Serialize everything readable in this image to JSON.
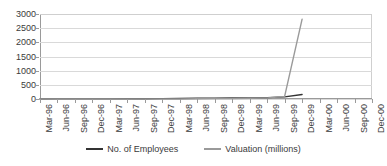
{
  "chart_data": {
    "type": "line",
    "title": "",
    "xlabel": "",
    "ylabel": "",
    "ylim": [
      0,
      3000
    ],
    "ytick_step": 500,
    "yticks": [
      "3000",
      "2500",
      "2000",
      "1500",
      "1000",
      "500",
      "0"
    ],
    "grid": true,
    "legend_position": "bottom-center",
    "categories": [
      "Mar-96",
      "Jun-96",
      "Sep-96",
      "Dec-96",
      "Mar-97",
      "Jun-97",
      "Sep-97",
      "Dec-97",
      "Mar-98",
      "Jun-98",
      "Sep-98",
      "Dec-98",
      "Mar-99",
      "Jun-99",
      "Sep-99",
      "Dec-99",
      "Mar-00",
      "Jun-00",
      "Sep-00",
      "Dec-00"
    ],
    "series": [
      {
        "name": "No. of Employees",
        "color": "#333333",
        "values": [
          2,
          3,
          4,
          5,
          6,
          8,
          10,
          12,
          18,
          25,
          30,
          34,
          40,
          50,
          75,
          160,
          null,
          null,
          null,
          null
        ]
      },
      {
        "name": "Valuation (millions)",
        "color": "#9a9a9a",
        "values": [
          0,
          0,
          0,
          1,
          1,
          2,
          3,
          4,
          6,
          10,
          14,
          18,
          25,
          40,
          90,
          2820,
          null,
          null,
          null,
          null
        ]
      }
    ],
    "annotations": [
      "Valuation spikes sharply to approximately 2800 million around Dec-99 / early 2000",
      "Both series are flat near zero from Mar-96 through Sep-99",
      "No data plotted after early 2000 (Mar-00 through Dec-00 axis labels remain empty)"
    ]
  },
  "legend": {
    "entries": [
      {
        "label": "No. of Employees",
        "color": "#333333"
      },
      {
        "label": "Valuation (millions)",
        "color": "#9a9a9a"
      }
    ]
  }
}
